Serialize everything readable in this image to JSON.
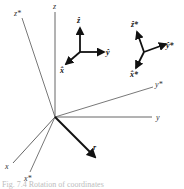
{
  "figure": {
    "caption": "Fig. 7.4 Rotation of coordinates",
    "colors": {
      "axis_line": "#555555",
      "vector": "#111111",
      "label": "#333333",
      "caption": "#bdbdbd"
    },
    "axes": {
      "z": "z",
      "z_star": "z*",
      "y": "y",
      "y_star": "y*",
      "x": "x",
      "x_star": "x*"
    },
    "position_vector": "r",
    "unit_triad": {
      "z_hat": "ẑ",
      "y_hat": "ŷ",
      "x_hat": "x̂"
    },
    "rotated_triad": {
      "z_hat_star": "ẑ*",
      "y_hat_star": "ŷ*",
      "x_hat_star": "x̂*"
    }
  }
}
